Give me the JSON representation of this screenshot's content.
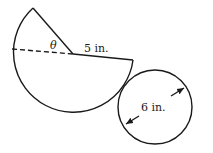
{
  "figure": {
    "sector": {
      "radius_label": "5 in.",
      "angle_label": "θ",
      "description": "Circular sector with a removed wedge; dashed line marks one radius"
    },
    "circle": {
      "diameter_label": "6 in.",
      "description": "Circle with double-headed arrow indicating diameter"
    }
  },
  "colors": {
    "stroke": "#1a1a1a",
    "background": "#ffffff"
  }
}
